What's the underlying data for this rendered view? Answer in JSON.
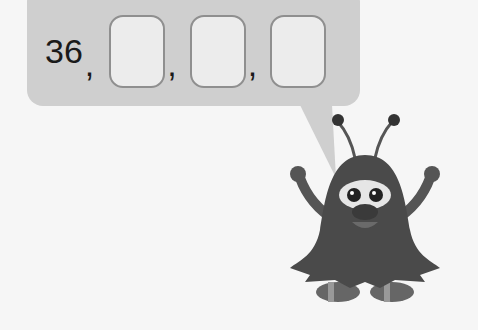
{
  "sequence": {
    "first_value": "36",
    "separator": ",",
    "blanks": [
      {
        "id": 1,
        "value": ""
      },
      {
        "id": 2,
        "value": ""
      },
      {
        "id": 3,
        "value": ""
      }
    ]
  },
  "colors": {
    "bubble": "#cfcfcf",
    "box_border": "#8f8f8f",
    "box_fill": "#ececec",
    "monster_body": "#4a4a4a"
  },
  "character": {
    "name": "monster-mascot"
  }
}
